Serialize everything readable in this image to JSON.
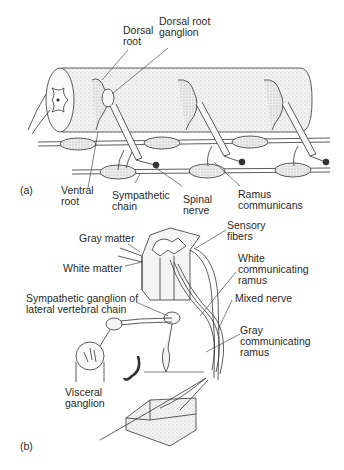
{
  "panel_a": {
    "tag": "(a)",
    "labels": {
      "dorsal_root": "Dorsal\nroot",
      "dorsal_root_ganglion": "Dorsal root\nganglion",
      "ventral_root": "Ventral\nroot",
      "sympathetic_chain": "Sympathetic\nchain",
      "spinal_nerve": "Spinal\nnerve",
      "ramus_communicans": "Ramus\ncommunicans"
    }
  },
  "panel_b": {
    "tag": "(b)",
    "labels": {
      "gray_matter": "Gray matter",
      "white_matter": "White matter",
      "sensory_fibers": "Sensory\nfibers",
      "white_communicating_ramus": "White\ncommunicating\nramus",
      "mixed_nerve": "Mixed nerve",
      "sympathetic_ganglion": "Sympathetic ganglion of\nlateral vertebral chain",
      "gray_communicating_ramus": "Gray\ncommunicating\nramus",
      "visceral_ganglion": "Visceral\nganglion"
    }
  },
  "colors": {
    "ink": "#2a2a2a",
    "stipple": "#e6e6e6",
    "background": "#ffffff"
  }
}
